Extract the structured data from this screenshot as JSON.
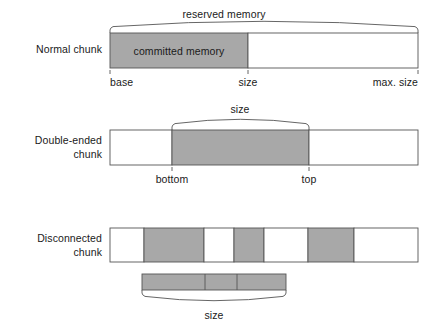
{
  "figure": {
    "width": 448,
    "height": 331,
    "background": "#ffffff",
    "stroke_color": "#555555",
    "fill_gray": "#a8a8a8",
    "fill_white": "#ffffff",
    "text_color": "#1a1a1a"
  },
  "rows": [
    {
      "id": "normal-chunk",
      "label": "Normal chunk",
      "bar": {
        "x": 110,
        "y": 33,
        "width": 308,
        "height": 35,
        "segments": [
          {
            "name": "committed",
            "x": 110,
            "width": 138,
            "fill": "gray",
            "label": "committed memory"
          },
          {
            "name": "uncommitted",
            "x": 248,
            "width": 170,
            "fill": "white",
            "label": ""
          }
        ]
      },
      "arc": {
        "label": "reserved memory",
        "from": 110,
        "to": 418,
        "direction": "up"
      },
      "ticks": [
        {
          "label": "base",
          "x": 110,
          "align": "left"
        },
        {
          "label": "size",
          "x": 248,
          "align": "center"
        },
        {
          "label": "max. size",
          "x": 418,
          "align": "right"
        }
      ]
    },
    {
      "id": "double-ended-chunk",
      "label": "Double-ended\nchunk",
      "bar": {
        "x": 110,
        "y": 130,
        "width": 308,
        "height": 35,
        "segments": [
          {
            "name": "below-bottom",
            "x": 110,
            "width": 62,
            "fill": "white",
            "label": ""
          },
          {
            "name": "in-use",
            "x": 172,
            "width": 137,
            "fill": "gray",
            "label": ""
          },
          {
            "name": "above-top",
            "x": 309,
            "width": 109,
            "fill": "white",
            "label": ""
          }
        ]
      },
      "arc": {
        "label": "size",
        "from": 172,
        "to": 309,
        "direction": "up"
      },
      "ticks": [
        {
          "label": "bottom",
          "x": 172,
          "align": "center"
        },
        {
          "label": "top",
          "x": 309,
          "align": "center"
        }
      ]
    },
    {
      "id": "disconnected-chunk",
      "label": "Disconnected\nchunk",
      "bar": {
        "x": 110,
        "y": 228,
        "width": 308,
        "height": 34,
        "segments": [
          {
            "name": "gap-1",
            "x": 110,
            "width": 34,
            "fill": "white",
            "label": ""
          },
          {
            "name": "used-1",
            "x": 144,
            "width": 60,
            "fill": "gray",
            "label": ""
          },
          {
            "name": "gap-2",
            "x": 204,
            "width": 30,
            "fill": "white",
            "label": ""
          },
          {
            "name": "used-2",
            "x": 234,
            "width": 30,
            "fill": "gray",
            "label": ""
          },
          {
            "name": "gap-3",
            "x": 264,
            "width": 44,
            "fill": "white",
            "label": ""
          },
          {
            "name": "used-3",
            "x": 308,
            "width": 46,
            "fill": "gray",
            "label": ""
          },
          {
            "name": "gap-4",
            "x": 354,
            "width": 64,
            "fill": "white",
            "label": ""
          }
        ]
      },
      "compacted_bar": {
        "x": 142,
        "y": 274,
        "width": 144,
        "height": 16,
        "fill": "gray",
        "dividers": [
          205,
          237
        ]
      },
      "arc": {
        "label": "size",
        "from": 142,
        "to": 286,
        "direction": "down"
      },
      "ticks": []
    }
  ]
}
